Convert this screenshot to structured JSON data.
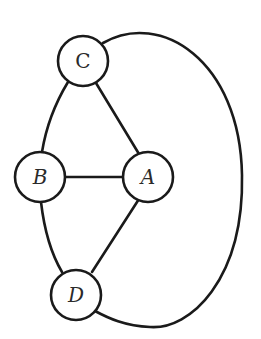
{
  "diagram": {
    "type": "graph",
    "nodes": [
      {
        "id": "C",
        "label": "C",
        "x": 83,
        "y": 61
      },
      {
        "id": "B",
        "label": "B",
        "x": 40,
        "y": 177
      },
      {
        "id": "A",
        "label": "A",
        "x": 148,
        "y": 177
      },
      {
        "id": "D",
        "label": "D",
        "x": 76,
        "y": 295
      }
    ],
    "edges": [
      {
        "from": "C",
        "to": "B",
        "shape": "curve"
      },
      {
        "from": "C",
        "to": "A",
        "shape": "straight"
      },
      {
        "from": "B",
        "to": "A",
        "shape": "straight"
      },
      {
        "from": "B",
        "to": "D",
        "shape": "curve"
      },
      {
        "from": "A",
        "to": "D",
        "shape": "straight"
      },
      {
        "from": "C",
        "to": "D",
        "shape": "outer-arc"
      }
    ],
    "colors": {
      "stroke": "#1a1a1a",
      "background": "#ffffff"
    }
  }
}
